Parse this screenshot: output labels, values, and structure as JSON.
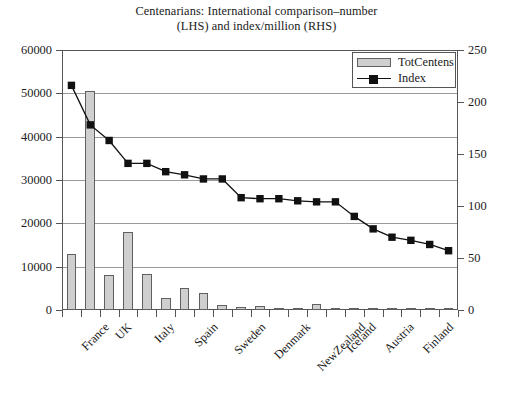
{
  "chart_data": {
    "type": "bar",
    "title": "Centenarians: International comparison–number (LHS) and index/million (RHS)",
    "title_lines": [
      "Centenarians: International comparison–number",
      "(LHS) and index/million (RHS)"
    ],
    "xlabel": "",
    "ylabel": "",
    "ylim": [
      0,
      60000
    ],
    "y2lim": [
      0,
      250
    ],
    "yticks": [
      0,
      10000,
      20000,
      30000,
      40000,
      50000,
      60000
    ],
    "ytick_labels": [
      "0",
      "10000",
      "20000",
      "30000",
      "40000",
      "50000",
      "60000"
    ],
    "y2ticks": [
      0,
      50,
      100,
      150,
      200,
      250
    ],
    "y2tick_labels": [
      "0",
      "50",
      "100",
      "150",
      "200",
      "250"
    ],
    "grid": true,
    "legend_position": "top-right",
    "categories": [
      "France",
      "",
      "UK",
      "",
      "Italy",
      "",
      "Spain",
      "",
      "Sweden",
      "",
      "Denmark",
      "",
      "NewZealand",
      "",
      "Iceland",
      "",
      "Austria",
      "",
      "Finland",
      "",
      ""
    ],
    "visible_tick_labels": [
      "France",
      "UK",
      "Italy",
      "Spain",
      "Sweden",
      "Denmark",
      "NewZealand",
      "Iceland",
      "Austria",
      "Finland"
    ],
    "series": [
      {
        "name": "TotCentens",
        "axis": "left",
        "render": "bar",
        "color": "#cfcfcf",
        "edge_color": "#606060",
        "values": [
          13000,
          50500,
          8000,
          17900,
          8300,
          2700,
          5100,
          3900,
          1100,
          700,
          900,
          400,
          250,
          1400,
          350,
          200,
          150,
          250,
          120,
          90,
          500
        ]
      },
      {
        "name": "Index",
        "axis": "right",
        "render": "line",
        "color": "#111111",
        "marker": "square",
        "values": [
          216,
          178,
          163,
          141,
          141,
          133,
          130,
          126,
          126,
          108,
          107,
          107,
          105,
          104,
          104,
          90,
          78,
          70,
          67,
          63,
          57
        ]
      }
    ]
  },
  "legend": {
    "entries": [
      {
        "label": "TotCentens",
        "type": "bar"
      },
      {
        "label": "Index",
        "type": "line-marker"
      }
    ]
  }
}
